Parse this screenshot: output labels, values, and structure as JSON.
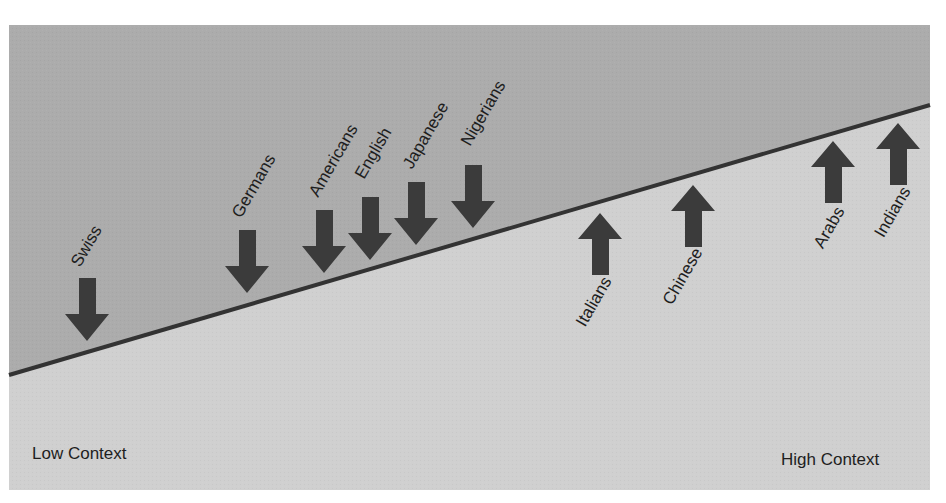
{
  "colors": {
    "upper": "#acacac",
    "lower": "#d0d0d0",
    "line": "#333333",
    "arrow": "#3b3b3b",
    "text": "#1e1e1e"
  },
  "axis": {
    "left_label": "Low Context",
    "right_label": "High Context"
  },
  "cultures": [
    {
      "name": "Swiss",
      "direction": "down"
    },
    {
      "name": "Germans",
      "direction": "down"
    },
    {
      "name": "Americans",
      "direction": "down"
    },
    {
      "name": "English",
      "direction": "down"
    },
    {
      "name": "Japanese",
      "direction": "down"
    },
    {
      "name": "Nigerians",
      "direction": "down"
    },
    {
      "name": "Italians",
      "direction": "up"
    },
    {
      "name": "Chinese",
      "direction": "up"
    },
    {
      "name": "Arabs",
      "direction": "up"
    },
    {
      "name": "Indians",
      "direction": "up"
    }
  ]
}
